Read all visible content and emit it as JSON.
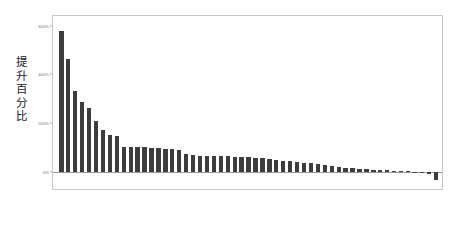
{
  "chart_data": {
    "type": "bar",
    "title": "",
    "subtitle": "",
    "xlabel": "",
    "ylabel": "提升百分比",
    "ylabel_chars": "提\n升\n百\n分\n比",
    "ylim": [
      -80,
      640
    ],
    "grid": false,
    "legend": false,
    "legend_position": "none",
    "bar_color": "#3d3d3d",
    "axis_color": "#c8c8c8",
    "zero_line_color": "#9a9a9a",
    "tick_label_color": "#6e6e6e",
    "y_ticks": [
      {
        "value": 0,
        "label": "0%"
      },
      {
        "value": 200,
        "label": "200%"
      },
      {
        "value": 400,
        "label": "400%"
      },
      {
        "value": 600,
        "label": "600%"
      }
    ],
    "categories": [
      "",
      "",
      "",
      "",
      "",
      "",
      "",
      "",
      "",
      "",
      "",
      "",
      "",
      "",
      "",
      "",
      "",
      "",
      "",
      "",
      "",
      "",
      "",
      "",
      "",
      "",
      "",
      "",
      "",
      "",
      "",
      "",
      "",
      "",
      "",
      "",
      "",
      "",
      "",
      "",
      "",
      "",
      "",
      "",
      "",
      "",
      "",
      "",
      "",
      "",
      "",
      "",
      "",
      "",
      ""
    ],
    "values": [
      578,
      462,
      330,
      285,
      262,
      210,
      172,
      152,
      146,
      103,
      101,
      100,
      99,
      96,
      95,
      94,
      92,
      90,
      72,
      68,
      66,
      65,
      64,
      63,
      62,
      61,
      60,
      58,
      56,
      54,
      52,
      46,
      44,
      42,
      40,
      36,
      34,
      30,
      26,
      22,
      18,
      15,
      13,
      11,
      9,
      7,
      6,
      5,
      4,
      3,
      2,
      -6,
      -8,
      -12,
      -34
    ]
  }
}
